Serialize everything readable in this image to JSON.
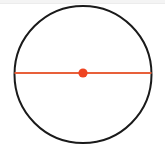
{
  "figure": {
    "name": "circle-with-diameter",
    "type": "geometry-diagram",
    "caption": "",
    "canvas": {
      "width": 165,
      "height": 146,
      "background_color": "#FFFFFF"
    },
    "top_band": {
      "color": "#F4F4F4",
      "height": 3
    },
    "circle": {
      "label": "circle-outline",
      "center_x": 83,
      "center_y": 74.5,
      "radius": 68.5,
      "stroke_color": "#1A1A1A",
      "stroke_width": 2,
      "fill": "none"
    },
    "diameter": {
      "label": "diameter-segment",
      "x1": 14.5,
      "y1": 73,
      "x2": 151.5,
      "y2": 73,
      "stroke_color": "#E8603A",
      "stroke_width": 2
    },
    "center_point": {
      "label": "center-point",
      "cx": 83,
      "cy": 73,
      "r": 4.6,
      "fill_color": "#EE4422"
    }
  }
}
